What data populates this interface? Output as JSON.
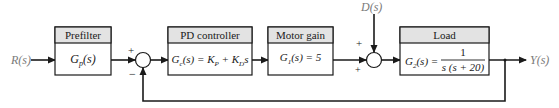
{
  "diagram": {
    "type": "block_diagram",
    "signals": {
      "input": "R(s)",
      "disturbance": "D(s)",
      "output": "Y(s)"
    },
    "blocks": [
      {
        "id": "prefilter",
        "title": "Prefilter",
        "expr": "Gₚ(s)",
        "expr_main": "G",
        "expr_sub": "p",
        "expr_tail": "(s)"
      },
      {
        "id": "pd_controller",
        "title": "PD controller",
        "expr_main": "G",
        "expr_sub": "c",
        "expr_tail": "(s) = K",
        "expr_sub2": "P",
        "expr_mid": " + K",
        "expr_sub3": "D",
        "expr_end": "s"
      },
      {
        "id": "motor_gain",
        "title": "Motor gain",
        "expr_main": "G",
        "expr_sub": "1",
        "expr_tail": "(s) = 5"
      },
      {
        "id": "load",
        "title": "Load",
        "expr_main": "G",
        "expr_sub": "2",
        "expr_tail": "(s) =",
        "numerator": "1",
        "denominator": "s (s + 20)"
      }
    ],
    "summing_junctions": [
      {
        "id": "sum1",
        "signs": {
          "top": "+",
          "bottom": "−"
        }
      },
      {
        "id": "sum2",
        "signs": {
          "top": "+",
          "bottom": "+"
        }
      }
    ],
    "colors": {
      "line": "#1a1a1a",
      "header_fill": "#e3e3e3",
      "signal_label": "#7a7a7a"
    }
  }
}
